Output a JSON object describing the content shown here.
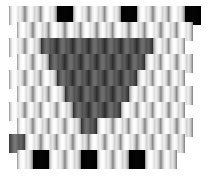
{
  "canvas": {
    "title": "Cylindrical tile mosaic",
    "width": 210,
    "height": 178,
    "background_color": "#ffffff",
    "tile_width": 16,
    "tile_height": 19,
    "row_vertical_pitch": 16,
    "layout": "offset-brick"
  },
  "palette": {
    "light": "#ffffff",
    "light_shadow": "#7d7d7d",
    "dark": "#6e6e6e",
    "dark_shadow": "#292929",
    "mid": "#7a7a7a",
    "black": "#000000"
  },
  "legend": {
    "light_label": "light tile",
    "dark_label": "dark tile",
    "black_label": "black tile",
    "mid_label": "mid tile"
  },
  "mosaic": {
    "row_count": 10,
    "rows": [
      {
        "index": 0,
        "left": 9,
        "top": 6,
        "tiles": [
          "light",
          "light2",
          "light",
          "black",
          "light",
          "light2",
          "light",
          "black",
          "light",
          "light2",
          "light",
          "black"
        ]
      },
      {
        "index": 1,
        "left": 17,
        "top": 22,
        "tiles": [
          "light",
          "light2",
          "light",
          "light2",
          "light",
          "light2",
          "light",
          "light2",
          "light",
          "light2",
          "light"
        ]
      },
      {
        "index": 2,
        "left": 9,
        "top": 38,
        "tiles": [
          "light",
          "light2",
          "dark",
          "dark",
          "dark",
          "dark",
          "dark",
          "dark",
          "dark",
          "light2",
          "light"
        ]
      },
      {
        "index": 3,
        "left": 17,
        "top": 54,
        "tiles": [
          "light",
          "light2",
          "dark",
          "dark",
          "dark",
          "dark",
          "dark",
          "dark",
          "light2",
          "light",
          "light2"
        ]
      },
      {
        "index": 4,
        "left": 9,
        "top": 70,
        "tiles": [
          "light",
          "light2",
          "light",
          "dark",
          "dark",
          "dark",
          "dark",
          "dark",
          "light2",
          "light",
          "light2"
        ]
      },
      {
        "index": 5,
        "left": 17,
        "top": 86,
        "tiles": [
          "light",
          "light2",
          "light",
          "dark",
          "dark",
          "dark",
          "dark",
          "light2",
          "light",
          "light2",
          "light"
        ]
      },
      {
        "index": 6,
        "left": 9,
        "top": 102,
        "tiles": [
          "light",
          "light2",
          "light",
          "light2",
          "dark",
          "dark",
          "dark",
          "light",
          "light2",
          "light",
          "light2"
        ]
      },
      {
        "index": 7,
        "left": 17,
        "top": 118,
        "tiles": [
          "light",
          "light2",
          "light",
          "light2",
          "dark",
          "light",
          "light2",
          "light",
          "light2",
          "light",
          "light2"
        ]
      },
      {
        "index": 8,
        "left": 9,
        "top": 134,
        "tiles": [
          "mid",
          "light",
          "light2",
          "light",
          "light2",
          "light",
          "light2",
          "light",
          "light2",
          "light",
          "light2"
        ]
      },
      {
        "index": 9,
        "left": 17,
        "top": 150,
        "tiles": [
          "light",
          "black",
          "light",
          "light2",
          "black",
          "light",
          "light2",
          "black",
          "light",
          "light2"
        ]
      }
    ]
  }
}
